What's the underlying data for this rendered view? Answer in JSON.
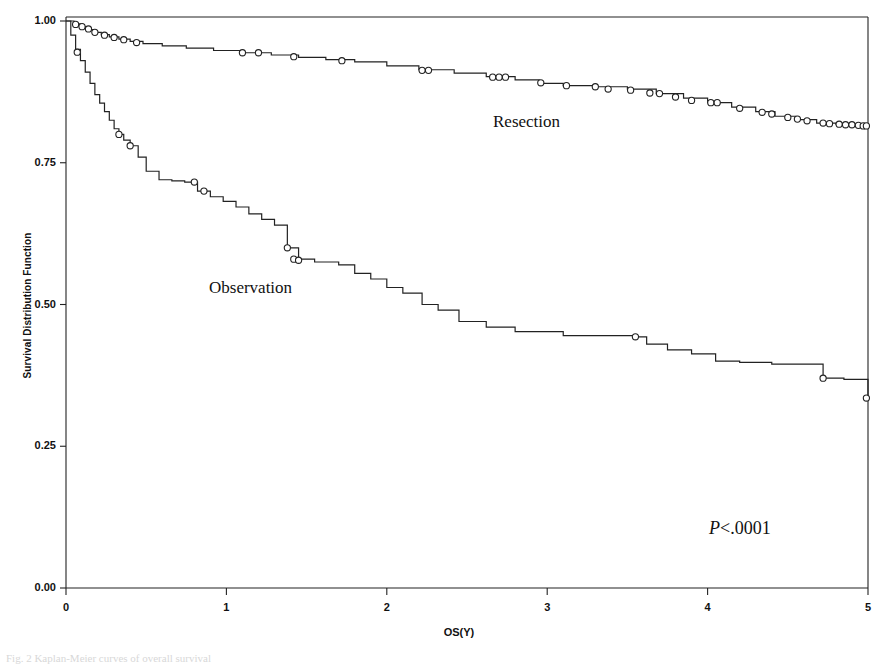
{
  "figure": {
    "caption": "Fig. 2 Kaplan-Meier curves of overall survival",
    "annotations": {
      "resection_label": "Resection",
      "observation_label": "Observation",
      "pvalue_p": "P",
      "pvalue_rest": "<.0001"
    }
  },
  "chart_data": {
    "type": "line",
    "title": "",
    "xlabel": "OS(Y)",
    "ylabel": "Survival Distribution Function",
    "xlim": [
      0,
      5
    ],
    "ylim": [
      0,
      1
    ],
    "xticks": [
      0,
      1,
      2,
      3,
      4,
      5
    ],
    "xtick_labels": [
      "0",
      "1",
      "2",
      "3",
      "4",
      "5"
    ],
    "yticks": [
      0.0,
      0.25,
      0.5,
      0.75,
      1.0
    ],
    "ytick_labels": [
      "0.00",
      "0.25",
      "0.50",
      "0.75",
      "1.00"
    ],
    "grid": false,
    "legend_position": "in-plot-annotation",
    "line_color": "#222222",
    "censor_marker": "open-circle",
    "series": [
      {
        "name": "Resection",
        "step": "post",
        "x": [
          0.0,
          0.05,
          0.09,
          0.13,
          0.17,
          0.22,
          0.27,
          0.33,
          0.4,
          0.48,
          0.6,
          0.75,
          0.92,
          1.1,
          1.28,
          1.45,
          1.62,
          1.8,
          2.0,
          2.2,
          2.42,
          2.62,
          2.8,
          2.95,
          3.1,
          3.3,
          3.5,
          3.68,
          3.85,
          4.0,
          4.15,
          4.3,
          4.42,
          4.55,
          4.68,
          4.8,
          4.92,
          5.0
        ],
        "y": [
          1.0,
          0.995,
          0.99,
          0.985,
          0.98,
          0.976,
          0.972,
          0.968,
          0.964,
          0.96,
          0.956,
          0.952,
          0.948,
          0.944,
          0.94,
          0.936,
          0.932,
          0.928,
          0.921,
          0.914,
          0.908,
          0.902,
          0.896,
          0.89,
          0.886,
          0.884,
          0.88,
          0.872,
          0.864,
          0.856,
          0.848,
          0.84,
          0.832,
          0.826,
          0.82,
          0.818,
          0.816,
          0.815
        ],
        "censor_x": [
          0.06,
          0.1,
          0.14,
          0.18,
          0.24,
          0.3,
          0.36,
          0.44,
          1.1,
          1.2,
          1.42,
          1.72,
          2.22,
          2.26,
          2.66,
          2.7,
          2.74,
          2.96,
          3.12,
          3.3,
          3.38,
          3.52,
          3.64,
          3.7,
          3.8,
          3.9,
          4.02,
          4.06,
          4.2,
          4.34,
          4.4,
          4.5,
          4.56,
          4.62,
          4.72,
          4.76,
          4.82,
          4.86,
          4.9,
          4.94,
          4.97,
          4.99
        ],
        "censor_y": [
          0.994,
          0.99,
          0.986,
          0.98,
          0.975,
          0.971,
          0.967,
          0.962,
          0.944,
          0.944,
          0.937,
          0.93,
          0.913,
          0.913,
          0.901,
          0.901,
          0.901,
          0.891,
          0.886,
          0.884,
          0.88,
          0.878,
          0.873,
          0.872,
          0.866,
          0.86,
          0.856,
          0.856,
          0.846,
          0.839,
          0.836,
          0.83,
          0.827,
          0.824,
          0.82,
          0.819,
          0.818,
          0.817,
          0.817,
          0.816,
          0.815,
          0.815
        ]
      },
      {
        "name": "Observation",
        "step": "post",
        "x": [
          0.0,
          0.03,
          0.06,
          0.09,
          0.12,
          0.15,
          0.18,
          0.21,
          0.24,
          0.27,
          0.3,
          0.33,
          0.36,
          0.4,
          0.45,
          0.5,
          0.58,
          0.66,
          0.74,
          0.82,
          0.9,
          0.98,
          1.06,
          1.14,
          1.22,
          1.3,
          1.38,
          1.45,
          1.55,
          1.7,
          1.8,
          1.9,
          2.0,
          2.1,
          2.22,
          2.32,
          2.45,
          2.62,
          2.8,
          3.1,
          3.55,
          3.62,
          3.75,
          3.9,
          4.05,
          4.2,
          4.4,
          4.72,
          4.85,
          5.0
        ],
        "y": [
          1.0,
          0.975,
          0.95,
          0.93,
          0.91,
          0.89,
          0.87,
          0.855,
          0.84,
          0.825,
          0.81,
          0.8,
          0.79,
          0.78,
          0.76,
          0.735,
          0.72,
          0.718,
          0.716,
          0.7,
          0.69,
          0.682,
          0.672,
          0.66,
          0.65,
          0.64,
          0.6,
          0.58,
          0.575,
          0.57,
          0.555,
          0.545,
          0.53,
          0.52,
          0.5,
          0.49,
          0.47,
          0.46,
          0.452,
          0.445,
          0.443,
          0.43,
          0.42,
          0.413,
          0.4,
          0.398,
          0.395,
          0.37,
          0.368,
          0.335
        ],
        "censor_x": [
          0.07,
          0.33,
          0.4,
          0.8,
          0.86,
          1.38,
          1.42,
          1.45,
          3.55,
          4.72,
          4.99
        ],
        "censor_y": [
          0.945,
          0.8,
          0.78,
          0.716,
          0.7,
          0.6,
          0.58,
          0.578,
          0.443,
          0.37,
          0.335
        ]
      }
    ]
  }
}
